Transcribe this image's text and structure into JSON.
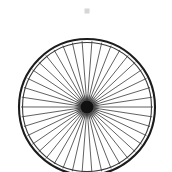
{
  "canvas": {
    "width": 172,
    "height": 172,
    "background_color": "#ffffff",
    "alt_text": "Bicycle wheel with spokes"
  },
  "subject": {
    "name": "bicycle-wheel",
    "label": "Bicycle wheel",
    "description": "Front view line illustration of a spoked bicycle wheel on a plain white background"
  },
  "wheel": {
    "center_x": 87,
    "center_y": 107,
    "rim_outer_radius": 68,
    "rim_inner_radius": 64.5,
    "rim_color": "#1c1c1c",
    "rim_stroke_width": 2.1,
    "rim_inner_stroke_width": 1.1,
    "rim_inner_color": "#3a3a3a",
    "clipped_edge": "bottom"
  },
  "spokes": {
    "count": 42,
    "color": "#585858",
    "stroke_width": 0.95,
    "start_radius": 7,
    "end_radius": 66,
    "angle_offset_deg": 4.3
  },
  "hub": {
    "center_x": 87,
    "center_y": 107,
    "core_radius": 6.5,
    "core_color": "#111111",
    "halo_radius": 13,
    "halo_color": "#2a2a2a"
  },
  "artifact": {
    "name": "speck",
    "x": 87,
    "y": 11,
    "width": 5,
    "height": 5,
    "color": "#d6d6d6",
    "visible": true
  }
}
